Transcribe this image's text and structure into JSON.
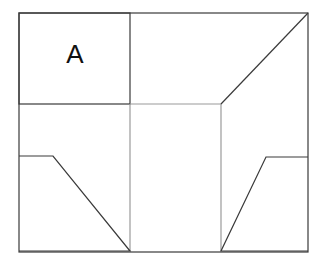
{
  "figure": {
    "background_color": "#ffffff",
    "stroke_dark": "#3a3a3a",
    "stroke_light": "#9a9a9a",
    "stroke_width": 1.2,
    "canvas": {
      "width": 328,
      "height": 268
    },
    "labels": [
      {
        "id": "room-a",
        "text": "A",
        "x": 75,
        "y": 56,
        "font_size": 26,
        "color": "#111111"
      }
    ],
    "shapes": [
      {
        "id": "outer-frame",
        "name": "outer-frame",
        "type": "rect",
        "x": 19,
        "y": 13,
        "width": 289,
        "height": 239,
        "stroke": "#3a3a3a",
        "fill": "none"
      },
      {
        "id": "room-a-box",
        "name": "room-a-box",
        "type": "rect",
        "x": 19,
        "y": 13,
        "width": 111,
        "height": 91,
        "stroke": "#3a3a3a",
        "fill": "none"
      },
      {
        "id": "mid-horizontal-divider",
        "name": "mid-horizontal-divider",
        "type": "polyline",
        "points": "130,104 221,104",
        "stroke": "#9a9a9a",
        "fill": "none"
      },
      {
        "id": "mid-vertical-divider",
        "name": "mid-vertical-divider",
        "type": "polyline",
        "points": "130,104 130,251",
        "stroke": "#9a9a9a",
        "fill": "none"
      },
      {
        "id": "right-vertical-divider",
        "name": "right-vertical-divider",
        "type": "polyline",
        "points": "221,104 221,251",
        "stroke": "#9a9a9a",
        "fill": "none"
      },
      {
        "id": "upper-right-diagonal",
        "name": "upper-right-diagonal",
        "type": "polyline",
        "points": "221,104 308,13",
        "stroke": "#3a3a3a",
        "fill": "none"
      },
      {
        "id": "lower-left-trapezoid",
        "name": "lower-left-trapezoid",
        "type": "polyline",
        "points": "19,156 53,156 130,251 19,251",
        "stroke": "#3a3a3a",
        "fill": "none"
      },
      {
        "id": "lower-right-trapezoid",
        "name": "lower-right-trapezoid",
        "type": "polyline",
        "points": "308,157 266,157 221,251 308,251",
        "stroke": "#3a3a3a",
        "fill": "none"
      }
    ]
  }
}
